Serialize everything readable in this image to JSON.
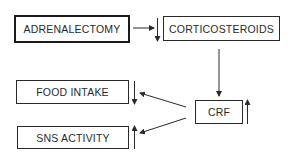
{
  "diagram": {
    "nodes": [
      {
        "id": "adrenalectomy",
        "label": "ADRENALECTOMY",
        "emphasis": "thick-border"
      },
      {
        "id": "corticosteroids",
        "label": "CORTICOSTEROIDS",
        "change": "decrease"
      },
      {
        "id": "crf",
        "label": "CRF",
        "change": "increase"
      },
      {
        "id": "food_intake",
        "label": "FOOD INTAKE",
        "change": "decrease"
      },
      {
        "id": "sns_activity",
        "label": "SNS ACTIVITY",
        "change": "increase"
      }
    ],
    "edges": [
      {
        "from": "adrenalectomy",
        "to": "corticosteroids"
      },
      {
        "from": "corticosteroids",
        "to": "crf"
      },
      {
        "from": "crf",
        "to": "food_intake"
      },
      {
        "from": "crf",
        "to": "sns_activity"
      }
    ],
    "colors": {
      "line": "#2a2a2a",
      "background": "#ffffff"
    }
  }
}
